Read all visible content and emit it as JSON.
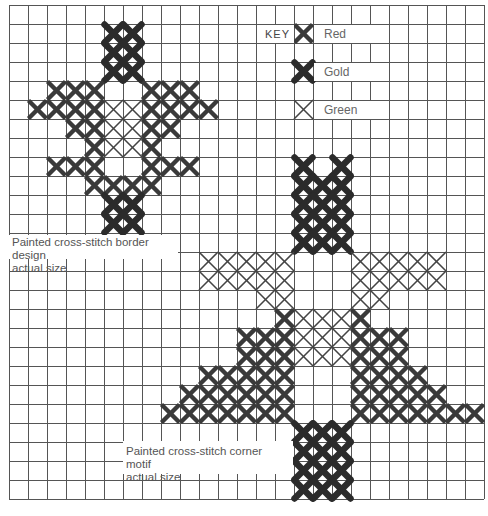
{
  "grid": {
    "origin_x": 9,
    "origin_y": 5,
    "cell": 19,
    "cols": 25,
    "rows": 26,
    "line_color": "#555555"
  },
  "colors": {
    "red": "#3a3a3a",
    "gold": "#2b2b2b",
    "green": "#444444"
  },
  "key": {
    "title": "KEY",
    "title_cell": {
      "col": 13,
      "row": 1,
      "span": 2
    },
    "items": [
      {
        "type": "red",
        "label": "Red",
        "col": 15,
        "row": 1
      },
      {
        "type": "gold",
        "label": "Gold",
        "col": 15,
        "row": 3
      },
      {
        "type": "green",
        "label": "Green",
        "col": 15,
        "row": 5
      }
    ],
    "label_span": 4
  },
  "motifs": [
    {
      "name": "border-design",
      "caption_line1": "Painted cross-stitch border design",
      "caption_line2": "actual size",
      "caption_box": {
        "x": 9,
        "y": 235,
        "w": 169,
        "h": 24
      },
      "stitches": [
        {
          "row": 1,
          "gold": [
            5,
            6
          ]
        },
        {
          "row": 2,
          "gold": [
            5,
            6
          ]
        },
        {
          "row": 3,
          "gold": [
            5,
            6
          ]
        },
        {
          "row": 4,
          "red": [
            2,
            3,
            4,
            7,
            8,
            9
          ]
        },
        {
          "row": 5,
          "red": [
            1,
            2,
            3,
            4,
            7,
            8,
            9,
            10
          ],
          "green": [
            5,
            6
          ]
        },
        {
          "row": 6,
          "red": [
            3,
            4,
            7,
            8
          ],
          "green": [
            5,
            6
          ]
        },
        {
          "row": 7,
          "red": [
            4,
            7
          ],
          "green": [
            5,
            6
          ]
        },
        {
          "row": 8,
          "red": [
            2,
            3,
            4,
            7,
            8,
            9
          ]
        },
        {
          "row": 9,
          "red": [
            4,
            5,
            6,
            7
          ]
        },
        {
          "row": 10,
          "gold": [
            5,
            6
          ]
        },
        {
          "row": 11,
          "gold": [
            5,
            6
          ]
        }
      ]
    },
    {
      "name": "corner-motif",
      "caption_line1": "Painted cross-stitch corner motif",
      "caption_line2": "actual size",
      "caption_box": {
        "x": 123,
        "y": 441,
        "w": 170,
        "h": 33
      },
      "stitches": [
        {
          "row": 8,
          "gold": [
            15,
            17
          ]
        },
        {
          "row": 9,
          "gold": [
            15,
            16,
            17
          ]
        },
        {
          "row": 10,
          "gold": [
            15,
            16,
            17
          ]
        },
        {
          "row": 11,
          "gold": [
            15,
            16,
            17
          ]
        },
        {
          "row": 12,
          "gold": [
            15,
            16,
            17
          ]
        },
        {
          "row": 13,
          "green": [
            10,
            11,
            12,
            13,
            14,
            18,
            19,
            20,
            21,
            22
          ]
        },
        {
          "row": 14,
          "green": [
            10,
            11,
            12,
            13,
            14,
            18,
            19,
            20,
            21,
            22
          ]
        },
        {
          "row": 15,
          "green": [
            13,
            14,
            18,
            19
          ]
        },
        {
          "row": 16,
          "red": [
            14,
            18
          ],
          "green": [
            15,
            16,
            17
          ]
        },
        {
          "row": 17,
          "red": [
            12,
            13,
            14,
            18,
            19,
            20
          ],
          "green": [
            15,
            16,
            17
          ]
        },
        {
          "row": 18,
          "red": [
            12,
            13,
            14,
            18,
            19,
            20
          ],
          "green": [
            15,
            16,
            17
          ]
        },
        {
          "row": 19,
          "red": [
            10,
            11,
            12,
            13,
            14,
            18,
            19,
            20,
            21
          ]
        },
        {
          "row": 20,
          "red": [
            9,
            10,
            11,
            12,
            13,
            14,
            18,
            19,
            20,
            21,
            22
          ]
        },
        {
          "row": 21,
          "red": [
            8,
            9,
            10,
            11,
            12,
            13,
            14,
            18,
            19,
            20,
            21,
            22,
            23,
            24
          ]
        },
        {
          "row": 22,
          "gold": [
            15,
            16,
            17
          ]
        },
        {
          "row": 23,
          "gold": [
            15,
            16,
            17
          ]
        },
        {
          "row": 24,
          "gold": [
            15,
            16,
            17
          ]
        },
        {
          "row": 25,
          "gold": [
            15,
            16,
            17
          ]
        }
      ]
    }
  ]
}
